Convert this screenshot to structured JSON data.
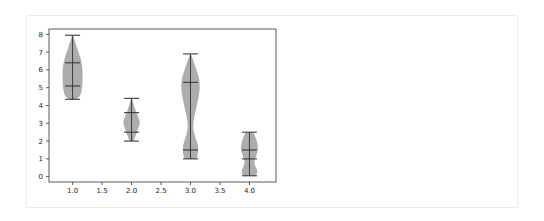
{
  "chart_data": {
    "type": "violin",
    "title": "",
    "xlabel": "",
    "ylabel": "",
    "xlim": [
      0.6,
      4.45
    ],
    "ylim": [
      -0.3,
      8.3
    ],
    "grid": false,
    "legend": null,
    "x_ticks": [
      "1.0",
      "1.5",
      "2.0",
      "2.5",
      "3.0",
      "3.5",
      "4.0"
    ],
    "x_tick_values": [
      1.0,
      1.5,
      2.0,
      2.5,
      3.0,
      3.5,
      4.0
    ],
    "y_ticks": [
      "0",
      "1",
      "2",
      "3",
      "4",
      "5",
      "6",
      "7",
      "8"
    ],
    "y_tick_values": [
      0,
      1,
      2,
      3,
      4,
      5,
      6,
      7,
      8
    ],
    "fill_color": "#a9a9a9",
    "line_color": "#3a3a3a",
    "series": [
      {
        "position": 1.0,
        "min": 4.35,
        "lower_quantile": 5.1,
        "upper_quantile": 6.4,
        "max": 7.95,
        "shape": [
          [
            4.35,
            0.05
          ],
          [
            4.5,
            0.13
          ],
          [
            4.9,
            0.16
          ],
          [
            5.4,
            0.17
          ],
          [
            6.0,
            0.17
          ],
          [
            6.5,
            0.15
          ],
          [
            7.0,
            0.1
          ],
          [
            7.5,
            0.05
          ],
          [
            7.95,
            0.01
          ]
        ]
      },
      {
        "position": 2.0,
        "min": 2.0,
        "lower_quantile": 2.5,
        "upper_quantile": 3.6,
        "max": 4.4,
        "shape": [
          [
            2.0,
            0.03
          ],
          [
            2.3,
            0.07
          ],
          [
            2.6,
            0.1
          ],
          [
            3.0,
            0.15
          ],
          [
            3.3,
            0.12
          ],
          [
            3.6,
            0.08
          ],
          [
            4.0,
            0.04
          ],
          [
            4.4,
            0.01
          ]
        ]
      },
      {
        "position": 3.0,
        "min": 1.0,
        "lower_quantile": 1.5,
        "upper_quantile": 5.3,
        "max": 6.9,
        "shape": [
          [
            1.0,
            0.1
          ],
          [
            1.3,
            0.13
          ],
          [
            1.8,
            0.13
          ],
          [
            2.3,
            0.07
          ],
          [
            2.8,
            0.04
          ],
          [
            3.3,
            0.06
          ],
          [
            3.9,
            0.1
          ],
          [
            4.5,
            0.14
          ],
          [
            5.0,
            0.16
          ],
          [
            5.5,
            0.15
          ],
          [
            6.0,
            0.1
          ],
          [
            6.5,
            0.05
          ],
          [
            6.9,
            0.01
          ]
        ]
      },
      {
        "position": 4.0,
        "min": 0.05,
        "lower_quantile": 1.0,
        "upper_quantile": 1.5,
        "max": 2.5,
        "shape": [
          [
            0.05,
            0.1
          ],
          [
            0.3,
            0.15
          ],
          [
            0.6,
            0.09
          ],
          [
            0.9,
            0.08
          ],
          [
            1.2,
            0.12
          ],
          [
            1.6,
            0.15
          ],
          [
            2.0,
            0.13
          ],
          [
            2.3,
            0.09
          ],
          [
            2.5,
            0.07
          ]
        ]
      }
    ]
  }
}
